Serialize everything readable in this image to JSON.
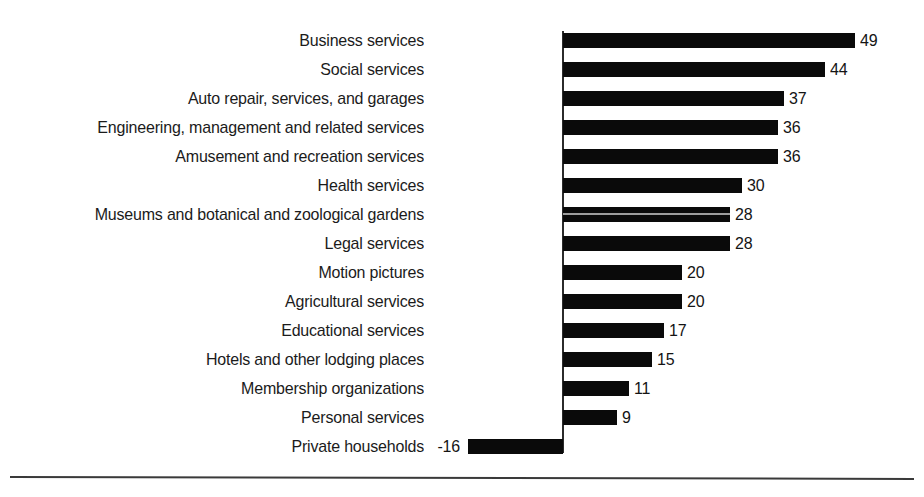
{
  "chart_data": {
    "type": "bar",
    "orientation": "horizontal",
    "title": "",
    "subtitle": "",
    "xlabel": "",
    "ylabel": "",
    "grid": false,
    "legend": null,
    "xlim": [
      -16,
      49
    ],
    "zero_line": true,
    "categories": [
      "Business services",
      "Social services",
      "Auto repair, services, and garages",
      "Engineering, management and related services",
      "Amusement and recreation services",
      "Health services",
      "Museums and botanical and zoological gardens",
      "Legal services",
      "Motion pictures",
      "Agricultural services",
      "Educational services",
      "Hotels and other lodging places",
      "Membership organizations",
      "Personal services",
      "Private households"
    ],
    "values": [
      49,
      44,
      37,
      36,
      36,
      30,
      28,
      28,
      20,
      20,
      17,
      15,
      11,
      9,
      -16
    ],
    "value_labels": [
      "49",
      "44",
      "37",
      "36",
      "36",
      "30",
      "28",
      "28",
      "20",
      "20",
      "17",
      "15",
      "11",
      "9",
      "-16"
    ],
    "bar_color": "#0a0a0a",
    "background_color": "#ffffff",
    "text_color": "#1b1b1b"
  },
  "layout": {
    "axis_x_px": 563,
    "px_per_unit": 5.96,
    "first_bar_top_px": 33,
    "row_pitch_px": 29,
    "bar_height_px": 15,
    "label_right_edge_px": 424,
    "axis_top_px": 31,
    "axis_bottom_px": 453,
    "bottom_rule_top_px": 476
  }
}
